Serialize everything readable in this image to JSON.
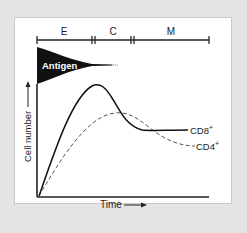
{
  "phases": [
    {
      "label": "E",
      "name": "expansion"
    },
    {
      "label": "C",
      "name": "contraction"
    },
    {
      "label": "M",
      "name": "memory"
    }
  ],
  "antigen_label": "Antigen",
  "axes": {
    "ylabel": "Cell number",
    "xlabel": "Time"
  },
  "series": [
    {
      "name": "CD8",
      "sup": "+",
      "style": "solid"
    },
    {
      "name": "CD4",
      "sup": "+",
      "style": "dashed"
    }
  ],
  "colors": {
    "background": "#e4e4e4",
    "panel": "#ffffff",
    "ink": "#111111"
  }
}
